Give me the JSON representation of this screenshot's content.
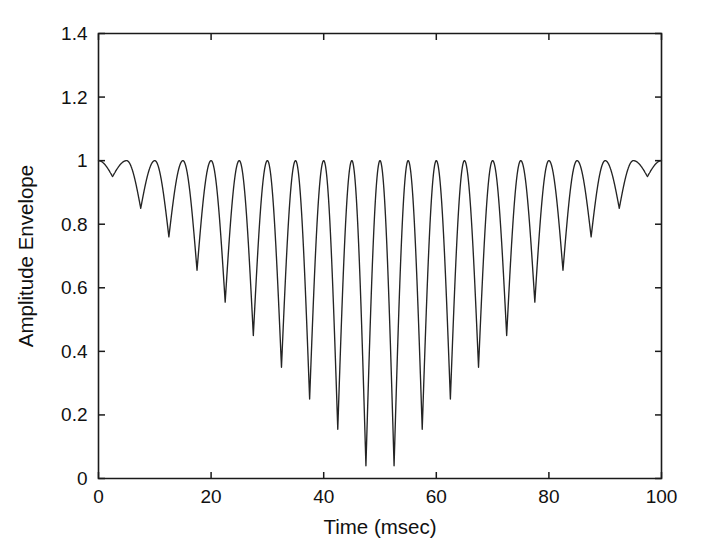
{
  "chart_data": {
    "type": "line",
    "title": "",
    "subtitle": "",
    "xlabel": "Time (msec)",
    "ylabel": "Amplitude Envelope",
    "xlim": [
      0,
      100
    ],
    "ylim": [
      0,
      1.4
    ],
    "xticks": [
      0,
      20,
      40,
      60,
      80,
      100
    ],
    "xticklabels": [
      "0",
      "20",
      "40",
      "60",
      "80",
      "100"
    ],
    "yticks": [
      0,
      0.2,
      0.4,
      0.6,
      0.8,
      1,
      1.2,
      1.4
    ],
    "yticklabels": [
      "0",
      "0.2",
      "0.4",
      "0.6",
      "0.8",
      "1",
      "1.2",
      "1.4"
    ],
    "grid": false,
    "legend": null,
    "line_color": "#242424",
    "background_color": "#ffffff",
    "series": [
      {
        "name": "amplitude envelope",
        "description": "Beating amplitude envelope: rectified oscillation with 5 msec period, peaks pinned at 1.0, minima deepening linearly toward a null at t = 50 msec.",
        "peak_value": 1.0,
        "oscillation_period_msec": 5,
        "num_peaks": 20,
        "peak_times_msec": [
          0,
          5,
          10,
          15,
          20,
          25,
          30,
          35,
          40,
          45,
          50,
          55,
          60,
          65,
          70,
          75,
          80,
          85,
          90,
          95,
          100
        ],
        "minimum_times_msec": [
          2.5,
          7.5,
          12.5,
          17.5,
          22.5,
          27.5,
          32.5,
          37.5,
          42.5,
          47.5,
          52.5,
          57.5,
          62.5,
          67.5,
          72.5,
          77.5,
          82.5,
          87.5,
          92.5,
          97.5
        ],
        "minimum_values": [
          0.95,
          0.85,
          0.76,
          0.655,
          0.555,
          0.45,
          0.35,
          0.25,
          0.155,
          0.04,
          0.04,
          0.155,
          0.25,
          0.35,
          0.45,
          0.555,
          0.655,
          0.76,
          0.85,
          0.95
        ],
        "symmetry_center_msec": 50,
        "null_depth": 0.04
      }
    ]
  },
  "figure": {
    "xlabel": "Time (msec)",
    "ylabel": "Amplitude Envelope"
  }
}
